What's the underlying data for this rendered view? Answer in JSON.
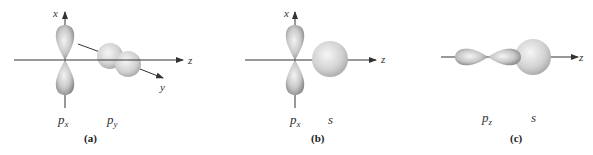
{
  "figure": {
    "panels": [
      {
        "id": "a",
        "caption": "(a)",
        "axis_labels": {
          "x": "x",
          "z": "z",
          "y": "y"
        },
        "orbitals": [
          {
            "name": "p",
            "sub": "x"
          },
          {
            "name": "p",
            "sub": "y"
          }
        ]
      },
      {
        "id": "b",
        "caption": "(b)",
        "axis_labels": {
          "x": "x",
          "z": "z"
        },
        "orbitals": [
          {
            "name": "p",
            "sub": "x"
          },
          {
            "name": "s",
            "sub": ""
          }
        ]
      },
      {
        "id": "c",
        "caption": "(c)",
        "axis_labels": {
          "z": "z"
        },
        "orbitals": [
          {
            "name": "p",
            "sub": "z"
          },
          {
            "name": "s",
            "sub": ""
          }
        ]
      }
    ],
    "colors": {
      "axis": "#333333",
      "lobe_light": "#eeeeee",
      "lobe_dark": "#8a8a8a",
      "sphere_light": "#f2f2f2",
      "sphere_dark": "#a9a9a9"
    }
  }
}
